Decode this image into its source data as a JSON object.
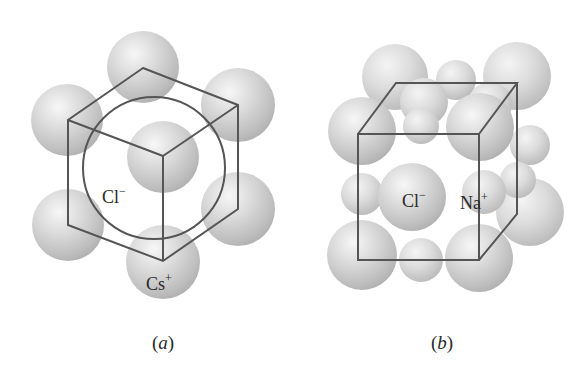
{
  "figure": {
    "panels": [
      {
        "id": "a",
        "caption": "(a)",
        "caption_letter": "a",
        "structure": "cesium chloride unit cell",
        "labels": {
          "anion": {
            "symbol": "Cl",
            "charge": "−"
          },
          "cation": {
            "symbol": "Cs",
            "charge": "+"
          }
        }
      },
      {
        "id": "b",
        "caption": "(b)",
        "caption_letter": "b",
        "structure": "sodium chloride unit cell",
        "labels": {
          "anion": {
            "symbol": "Cl",
            "charge": "−"
          },
          "cation": {
            "symbol": "Na",
            "charge": "+"
          }
        }
      }
    ],
    "colors": {
      "sphere_light": "#f2f2f2",
      "sphere_mid": "#cfcfcf",
      "sphere_dark": "#a9a9a9",
      "line": "#555555",
      "text": "#2a2a2a",
      "background": "#ffffff"
    }
  }
}
